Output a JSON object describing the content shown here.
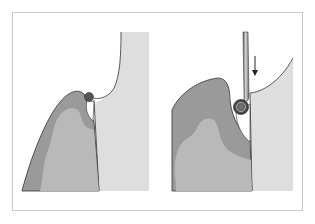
{
  "figure": {
    "panels": [
      {
        "id": "left",
        "description": "Gingival papilla with calculus deposit at tooth contact, before instrumentation"
      },
      {
        "id": "right",
        "description": "Instrument inserted along tooth surface engaging calculus deposit with downward motion"
      }
    ],
    "colors": {
      "frame_border": "#c9c9c9",
      "tooth": "#dedede",
      "gingiva_outer": "#9a9a9a",
      "gingiva_inner": "#b9b9b9",
      "calculus": "#555555",
      "outline": "#333333",
      "instrument": "#8a8a8a"
    },
    "annotations": {
      "arrow_direction": "down"
    }
  }
}
